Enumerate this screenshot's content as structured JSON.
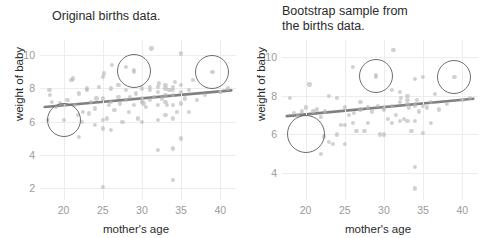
{
  "figure": {
    "width": 484,
    "height": 238,
    "background": "#ffffff",
    "point_color": "#b4b4b4",
    "line_color": "#808080",
    "highlight_color": "#6e6e6e",
    "grid_color": "#ededed",
    "tick_color": "#9a9a9a",
    "label_color": "#2b2b2b"
  },
  "chart_data": [
    {
      "type": "scatter",
      "panel": "left",
      "title": "Original births data.",
      "xlabel": "mother's age",
      "ylabel": "weight of baby",
      "xlim": [
        17.0,
        42.0
      ],
      "ylim": [
        1.3,
        10.9
      ],
      "xticks": [
        20,
        25,
        30,
        35,
        40
      ],
      "yticks": [
        2,
        4,
        6,
        8,
        10
      ],
      "grid": true,
      "legend": "none",
      "points": [
        [
          18.0,
          6.1
        ],
        [
          18.2,
          7.9
        ],
        [
          18.3,
          7.6
        ],
        [
          18.5,
          7.2
        ],
        [
          19.0,
          6.9
        ],
        [
          19.5,
          7.1
        ],
        [
          20.0,
          6.1
        ],
        [
          20.2,
          7.0
        ],
        [
          20.5,
          7.3
        ],
        [
          21.0,
          8.5
        ],
        [
          21.2,
          8.6
        ],
        [
          21.5,
          7.0
        ],
        [
          21.8,
          6.4
        ],
        [
          22.0,
          5.1
        ],
        [
          22.0,
          7.7
        ],
        [
          22.3,
          6.0
        ],
        [
          22.5,
          6.6
        ],
        [
          23.0,
          7.9
        ],
        [
          23.0,
          8.0
        ],
        [
          23.2,
          6.5
        ],
        [
          23.5,
          7.2
        ],
        [
          24.0,
          5.8
        ],
        [
          24.0,
          6.8
        ],
        [
          24.2,
          7.4
        ],
        [
          24.5,
          8.1
        ],
        [
          25.0,
          2.1
        ],
        [
          25.0,
          5.6
        ],
        [
          25.0,
          6.1
        ],
        [
          25.0,
          7.4
        ],
        [
          25.0,
          8.7
        ],
        [
          25.2,
          8.9
        ],
        [
          25.5,
          6.2
        ],
        [
          25.8,
          7.0
        ],
        [
          26.0,
          5.5
        ],
        [
          26.0,
          7.2
        ],
        [
          26.0,
          8.0
        ],
        [
          26.2,
          9.4
        ],
        [
          26.5,
          6.7
        ],
        [
          27.0,
          7.5
        ],
        [
          27.0,
          8.2
        ],
        [
          27.2,
          7.1
        ],
        [
          27.5,
          6.0
        ],
        [
          28.0,
          7.3
        ],
        [
          28.0,
          7.9
        ],
        [
          28.0,
          9.3
        ],
        [
          28.3,
          6.6
        ],
        [
          28.5,
          7.5
        ],
        [
          29.0,
          7.0
        ],
        [
          29.0,
          9.0
        ],
        [
          29.0,
          9.1
        ],
        [
          29.2,
          7.7
        ],
        [
          29.5,
          6.2
        ],
        [
          30.0,
          6.0
        ],
        [
          30.0,
          7.2
        ],
        [
          30.0,
          7.4
        ],
        [
          30.0,
          8.0
        ],
        [
          30.2,
          7.1
        ],
        [
          30.5,
          6.9
        ],
        [
          31.0,
          7.3
        ],
        [
          31.0,
          7.9
        ],
        [
          31.0,
          8.1
        ],
        [
          31.2,
          10.4
        ],
        [
          31.5,
          7.5
        ],
        [
          32.0,
          4.3
        ],
        [
          32.0,
          6.1
        ],
        [
          32.0,
          7.0
        ],
        [
          32.0,
          7.8
        ],
        [
          32.0,
          8.1
        ],
        [
          32.2,
          8.3
        ],
        [
          32.5,
          7.4
        ],
        [
          33.0,
          6.4
        ],
        [
          33.0,
          7.2
        ],
        [
          33.0,
          7.6
        ],
        [
          33.0,
          8.0
        ],
        [
          33.0,
          8.2
        ],
        [
          33.2,
          7.0
        ],
        [
          33.5,
          7.9
        ],
        [
          34.0,
          2.5
        ],
        [
          34.0,
          4.4
        ],
        [
          34.0,
          6.2
        ],
        [
          34.0,
          7.0
        ],
        [
          34.0,
          7.6
        ],
        [
          34.0,
          7.9
        ],
        [
          34.0,
          8.1
        ],
        [
          34.2,
          8.4
        ],
        [
          34.5,
          6.6
        ],
        [
          35.0,
          5.0
        ],
        [
          35.0,
          7.1
        ],
        [
          35.0,
          7.8
        ],
        [
          35.0,
          8.2
        ],
        [
          35.0,
          10.1
        ],
        [
          35.5,
          7.4
        ],
        [
          36.0,
          6.6
        ],
        [
          36.0,
          7.9
        ],
        [
          36.5,
          8.5
        ],
        [
          37.0,
          7.3
        ],
        [
          38.0,
          7.6
        ],
        [
          39.0,
          9.0
        ],
        [
          40.0,
          7.8
        ],
        [
          41.0,
          8.0
        ]
      ],
      "fit_line": {
        "x": [
          17.6,
          41.4
        ],
        "y": [
          6.88,
          7.88
        ]
      },
      "highlights": [
        {
          "x": 20.0,
          "y": 6.1,
          "r_px": 16
        },
        {
          "x": 29.0,
          "y": 9.05,
          "r_px": 16
        },
        {
          "x": 39.0,
          "y": 9.0,
          "r_px": 16
        }
      ]
    },
    {
      "type": "scatter",
      "panel": "right",
      "title": "Bootstrap sample from\nthe births data.",
      "xlabel": "mother's age",
      "ylabel": "weight of baby",
      "xlim": [
        17.0,
        42.0
      ],
      "ylim": [
        2.6,
        10.9
      ],
      "xticks": [
        20,
        25,
        30,
        35,
        40
      ],
      "yticks": [
        4,
        6,
        8,
        10
      ],
      "grid": true,
      "legend": "none",
      "points": [
        [
          18.0,
          7.9
        ],
        [
          18.5,
          7.1
        ],
        [
          19.0,
          7.0
        ],
        [
          19.5,
          7.2
        ],
        [
          20.0,
          7.4
        ],
        [
          20.5,
          8.6
        ],
        [
          21.0,
          7.2
        ],
        [
          21.5,
          7.3
        ],
        [
          22.0,
          5.0
        ],
        [
          22.0,
          6.9
        ],
        [
          22.3,
          5.9
        ],
        [
          22.5,
          7.2
        ],
        [
          23.0,
          5.6
        ],
        [
          23.0,
          8.0
        ],
        [
          23.5,
          5.5
        ],
        [
          24.0,
          6.0
        ],
        [
          24.0,
          7.9
        ],
        [
          24.5,
          6.5
        ],
        [
          25.0,
          5.5
        ],
        [
          25.0,
          6.5
        ],
        [
          25.0,
          7.4
        ],
        [
          25.5,
          7.0
        ],
        [
          26.0,
          6.6
        ],
        [
          26.0,
          9.5
        ],
        [
          26.2,
          7.1
        ],
        [
          26.5,
          6.2
        ],
        [
          27.0,
          7.3
        ],
        [
          27.0,
          7.7
        ],
        [
          27.5,
          6.2
        ],
        [
          28.0,
          6.6
        ],
        [
          28.0,
          7.4
        ],
        [
          28.5,
          7.2
        ],
        [
          29.0,
          9.0
        ],
        [
          29.0,
          9.1
        ],
        [
          29.2,
          7.5
        ],
        [
          29.5,
          6.0
        ],
        [
          30.0,
          6.0
        ],
        [
          30.0,
          7.3
        ],
        [
          30.0,
          7.4
        ],
        [
          30.5,
          6.8
        ],
        [
          31.0,
          6.6
        ],
        [
          31.0,
          7.5
        ],
        [
          31.0,
          8.3
        ],
        [
          31.2,
          10.4
        ],
        [
          31.5,
          7.0
        ],
        [
          32.0,
          6.7
        ],
        [
          32.0,
          7.7
        ],
        [
          32.0,
          8.2
        ],
        [
          32.2,
          7.9
        ],
        [
          32.5,
          6.8
        ],
        [
          33.0,
          6.7
        ],
        [
          33.0,
          7.6
        ],
        [
          33.0,
          7.8
        ],
        [
          33.0,
          8.0
        ],
        [
          33.2,
          7.4
        ],
        [
          33.5,
          6.2
        ],
        [
          34.0,
          3.2
        ],
        [
          34.0,
          4.3
        ],
        [
          34.0,
          6.7
        ],
        [
          34.0,
          7.5
        ],
        [
          34.0,
          7.6
        ],
        [
          34.0,
          8.9
        ],
        [
          34.2,
          7.8
        ],
        [
          34.5,
          7.2
        ],
        [
          35.0,
          6.1
        ],
        [
          35.0,
          7.5
        ],
        [
          35.0,
          9.0
        ],
        [
          35.5,
          7.4
        ],
        [
          36.0,
          6.6
        ],
        [
          36.0,
          7.7
        ],
        [
          36.5,
          8.1
        ],
        [
          37.0,
          7.3
        ],
        [
          38.0,
          7.6
        ],
        [
          39.0,
          9.0
        ],
        [
          40.0,
          7.8
        ],
        [
          41.0,
          7.9
        ]
      ],
      "fit_line": {
        "x": [
          17.6,
          41.4
        ],
        "y": [
          6.95,
          7.85
        ]
      },
      "highlights": [
        {
          "x": 20.0,
          "y": 6.0,
          "r_px": 18
        },
        {
          "x": 29.0,
          "y": 9.05,
          "r_px": 16
        },
        {
          "x": 39.0,
          "y": 9.0,
          "r_px": 16
        }
      ]
    }
  ]
}
